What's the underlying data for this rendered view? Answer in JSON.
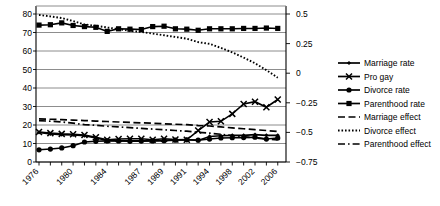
{
  "chart_data": {
    "type": "line",
    "title": "",
    "xlabel": "",
    "ylabel": "",
    "ylim": [
      0,
      80
    ],
    "y2lim": [
      -0.75,
      0.5
    ],
    "grid": true,
    "legend_position": "right",
    "x": [
      1976,
      1977,
      1978,
      1980,
      1982,
      1983,
      1984,
      1985,
      1986,
      1987,
      1988,
      1989,
      1990,
      1991,
      1993,
      1994,
      1996,
      1998,
      2000,
      2002,
      2004,
      2006
    ],
    "xtick_labels": [
      "1976",
      "1980",
      "1984",
      "1987",
      "1989",
      "1991",
      "1994",
      "1998",
      "2002",
      "2006"
    ],
    "left_ticks": [
      "0",
      "10",
      "20",
      "30",
      "40",
      "50",
      "60",
      "70",
      "80"
    ],
    "left_tick_values": [
      0,
      10,
      20,
      30,
      40,
      50,
      60,
      70,
      80
    ],
    "right_ticks": [
      "0.5",
      "0.25",
      "0",
      "-0.25",
      "-0.5",
      "-0.75"
    ],
    "right_tick_values": [
      0.5,
      0.25,
      0,
      -0.25,
      -0.5,
      -0.75
    ],
    "series": [
      {
        "name": "Marriage rate",
        "axis": "left",
        "marker": "small-diamond",
        "style": "solid",
        "values": [
          16.0,
          15.2,
          14.8,
          14.6,
          14.2,
          13.0,
          11.6,
          11.5,
          11.4,
          11.5,
          11.5,
          11.6,
          12.0,
          12.2,
          11.6,
          13.8,
          14.2,
          14.4,
          14.4,
          14.8,
          14.4,
          14.4
        ]
      },
      {
        "name": "Pro gay",
        "axis": "left",
        "marker": "cross",
        "style": "solid",
        "values": [
          16.2,
          15.6,
          15.2,
          15.0,
          14.6,
          13.4,
          12.0,
          12.4,
          12.6,
          12.6,
          12.0,
          12.6,
          12.2,
          12.0,
          17.0,
          21.6,
          22.0,
          26.0,
          31.4,
          32.6,
          29.6,
          33.8
        ]
      },
      {
        "name": "Divorce rate",
        "axis": "left",
        "marker": "circle",
        "style": "solid",
        "values": [
          6.6,
          7.0,
          7.6,
          8.8,
          10.8,
          11.2,
          11.4,
          11.4,
          11.2,
          11.3,
          11.4,
          11.5,
          11.8,
          12.0,
          11.8,
          12.4,
          13.0,
          13.1,
          13.2,
          13.4,
          12.4,
          13.0
        ]
      },
      {
        "name": "Parenthood rate",
        "axis": "left",
        "marker": "square",
        "style": "solid",
        "values": [
          74.0,
          74.2,
          75.2,
          73.8,
          73.2,
          72.8,
          70.6,
          72.0,
          71.8,
          71.6,
          73.2,
          73.4,
          72.0,
          71.8,
          71.2,
          72.0,
          72.0,
          72.0,
          72.2,
          72.2,
          72.4,
          72.2
        ]
      },
      {
        "name": "Marriage effect",
        "axis": "right",
        "marker": "none",
        "style": "dashed",
        "values": [
          -0.386,
          -0.389,
          -0.392,
          -0.396,
          -0.4,
          -0.404,
          -0.408,
          -0.412,
          -0.416,
          -0.419,
          -0.423,
          -0.427,
          -0.431,
          -0.435,
          -0.442,
          -0.446,
          -0.454,
          -0.462,
          -0.469,
          -0.477,
          -0.484,
          -0.492
        ]
      },
      {
        "name": "Divorce effect",
        "axis": "right",
        "marker": "none",
        "style": "dotted",
        "values": [
          0.492,
          0.48,
          0.466,
          0.44,
          0.412,
          0.4,
          0.386,
          0.372,
          0.358,
          0.348,
          0.334,
          0.32,
          0.306,
          0.292,
          0.262,
          0.248,
          0.214,
          0.176,
          0.132,
          0.084,
          0.026,
          -0.038
        ]
      },
      {
        "name": "Parenthood effect",
        "axis": "right",
        "marker": "none",
        "style": "dashdot",
        "values": [
          -0.4,
          -0.406,
          -0.412,
          -0.422,
          -0.434,
          -0.44,
          -0.448,
          -0.454,
          -0.46,
          -0.466,
          -0.472,
          -0.478,
          -0.484,
          -0.49,
          -0.5,
          -0.506,
          -0.516,
          -0.526,
          -0.536,
          -0.546,
          -0.556,
          -0.564
        ]
      }
    ]
  },
  "legend": {
    "items": [
      {
        "label": "Marriage rate",
        "marker": "small-diamond",
        "style": "solid"
      },
      {
        "label": "Pro gay",
        "marker": "cross",
        "style": "solid"
      },
      {
        "label": "Divorce rate",
        "marker": "circle",
        "style": "solid"
      },
      {
        "label": "Parenthood rate",
        "marker": "square",
        "style": "solid"
      },
      {
        "label": "Marriage effect",
        "marker": "none",
        "style": "dashed"
      },
      {
        "label": "Divorce effect",
        "marker": "none",
        "style": "dotted"
      },
      {
        "label": "Parenthood effect",
        "marker": "none",
        "style": "dashdot"
      }
    ]
  },
  "colors": {
    "line": "#000000",
    "grid": "#808080",
    "axis": "#000000",
    "background": "#ffffff"
  }
}
